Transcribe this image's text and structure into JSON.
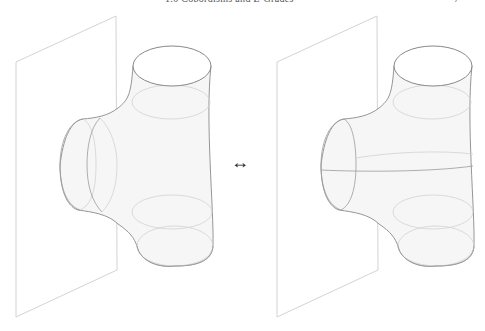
{
  "header": {
    "title": "1.6 Cobordisms and Z-Grades",
    "page_number": "7"
  },
  "figure": {
    "left_panel": {
      "label": "pair of pants cobordism with capping disk glued at wall (with inner circles)",
      "offset_x": 0
    },
    "right_panel": {
      "label": "equivalent cobordism with seam line through neck",
      "offset_x": 261
    },
    "relation_symbol": "↔"
  }
}
